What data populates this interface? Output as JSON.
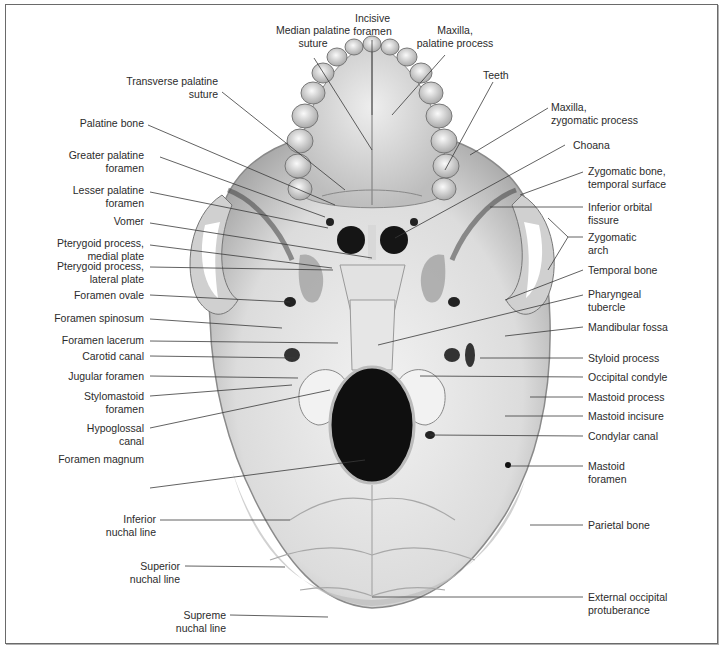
{
  "figure": {
    "labels_top": [
      {
        "id": "median-palatine-suture",
        "text": "Median palatine\nsuture"
      },
      {
        "id": "incisive-foramen",
        "text": "Incisive\nforamen"
      },
      {
        "id": "maxilla-palatine-process",
        "text": "Maxilla,\npalatine process"
      }
    ],
    "labels_left": [
      {
        "id": "transverse-palatine-suture",
        "text": "Transverse palatine\nsuture"
      },
      {
        "id": "palatine-bone",
        "text": "Palatine bone"
      },
      {
        "id": "greater-palatine-foramen",
        "text": "Greater palatine\nforamen"
      },
      {
        "id": "lesser-palatine-foramen",
        "text": "Lesser palatine\nforamen"
      },
      {
        "id": "vomer",
        "text": "Vomer"
      },
      {
        "id": "pterygoid-medial-plate",
        "text": "Pterygoid process,\nmedial plate"
      },
      {
        "id": "pterygoid-lateral-plate",
        "text": "Pterygoid process,\nlateral plate"
      },
      {
        "id": "foramen-ovale",
        "text": "Foramen ovale"
      },
      {
        "id": "foramen-spinosum",
        "text": "Foramen spinosum"
      },
      {
        "id": "foramen-lacerum",
        "text": "Foramen lacerum"
      },
      {
        "id": "carotid-canal",
        "text": "Carotid canal"
      },
      {
        "id": "jugular-foramen",
        "text": "Jugular foramen"
      },
      {
        "id": "stylomastoid-foramen",
        "text": "Stylomastoid\nforamen"
      },
      {
        "id": "hypoglossal-canal",
        "text": "Hypoglossal\ncanal"
      },
      {
        "id": "foramen-magnum",
        "text": "Foramen magnum"
      },
      {
        "id": "inferior-nuchal-line",
        "text": "Inferior\nnuchal line"
      },
      {
        "id": "superior-nuchal-line",
        "text": "Superior\nnuchal line"
      },
      {
        "id": "supreme-nuchal-line",
        "text": "Supreme\nnuchal line"
      }
    ],
    "labels_right": [
      {
        "id": "teeth",
        "text": "Teeth"
      },
      {
        "id": "maxilla-zygomatic-process",
        "text": "Maxilla,\nzygomatic process"
      },
      {
        "id": "choana",
        "text": "Choana"
      },
      {
        "id": "zygomatic-bone-temporal-surface",
        "text": "Zygomatic bone,\ntemporal surface"
      },
      {
        "id": "inferior-orbital-fissure",
        "text": "Inferior orbital\nfissure"
      },
      {
        "id": "zygomatic-arch",
        "text": "Zygomatic\narch"
      },
      {
        "id": "temporal-bone",
        "text": "Temporal bone"
      },
      {
        "id": "pharyngeal-tubercle",
        "text": "Pharyngeal\ntubercle"
      },
      {
        "id": "mandibular-fossa",
        "text": "Mandibular fossa"
      },
      {
        "id": "styloid-process",
        "text": "Styloid process"
      },
      {
        "id": "occipital-condyle",
        "text": "Occipital condyle"
      },
      {
        "id": "mastoid-process",
        "text": "Mastoid process"
      },
      {
        "id": "mastoid-incisure",
        "text": "Mastoid incisure"
      },
      {
        "id": "condylar-canal",
        "text": "Condylar canal"
      },
      {
        "id": "mastoid-foramen",
        "text": "Mastoid\nforamen"
      },
      {
        "id": "parietal-bone",
        "text": "Parietal bone"
      },
      {
        "id": "external-occipital-protuberance",
        "text": "External occipital\nprotuberance"
      }
    ],
    "colors": {
      "bone_light": "#ececec",
      "bone_mid": "#c8c8c8",
      "bone_dark": "#8e8e8e",
      "foramen": "#111111",
      "leader_line": "#3a3a3a",
      "label_text": "#2b2b2b",
      "frame": "#6a6a6a"
    }
  }
}
